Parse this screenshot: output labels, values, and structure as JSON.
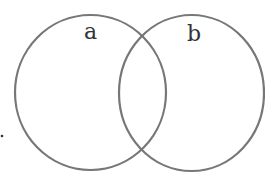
{
  "diagram": {
    "type": "venn",
    "sets": [
      {
        "label": "a",
        "cx": 90.5,
        "cy": 92.5,
        "rx": 75.5,
        "ry": 77.5
      },
      {
        "label": "b",
        "cx": 191.5,
        "cy": 93,
        "rx": 73,
        "ry": 78
      }
    ],
    "stroke_color": "#777777",
    "marker": "."
  }
}
